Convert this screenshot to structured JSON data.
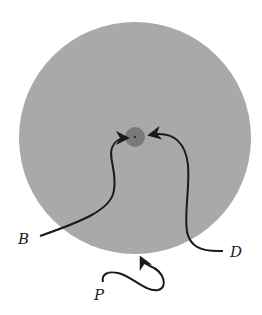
{
  "diagram": {
    "type": "annotated-circle",
    "colors": {
      "background": "#ffffff",
      "large_circle": "#a9a9a9",
      "small_circle": "#7a7a7a",
      "stroke": "#1a1a1a"
    },
    "large_circle": {
      "cx": 135,
      "cy": 138,
      "r": 116
    },
    "small_circle": {
      "cx": 135,
      "cy": 137,
      "r": 10
    },
    "labels": {
      "b": "B",
      "d": "D",
      "p": "P"
    }
  }
}
